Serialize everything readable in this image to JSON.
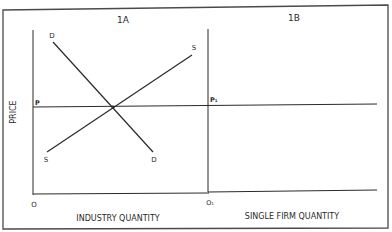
{
  "panels": {
    "left": {
      "title": "1A",
      "y_axis_label": "PRICE",
      "x_axis_label": "INDUSTRY QUANTITY",
      "origin_label": "O",
      "price_label": "P",
      "curves": {
        "supply_top_label": "S",
        "supply_bottom_label": "S",
        "demand_top_label": "D",
        "demand_bottom_label": "D"
      }
    },
    "right": {
      "title": "1B",
      "x_axis_label": "SINGLE FIRM QUANTITY",
      "origin_label": "O₁",
      "price_label": "P₁"
    }
  },
  "colors": {
    "line": "#2a2a2a",
    "frame": "#4a4a4a",
    "background": "#ffffff"
  }
}
